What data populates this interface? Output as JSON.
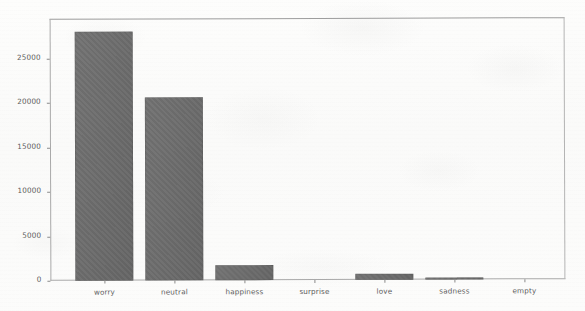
{
  "chart_data": {
    "type": "bar",
    "title": "",
    "subtitle": "",
    "xlabel": "",
    "ylabel": "",
    "categories": [
      "worry",
      "neutral",
      "happiness",
      "surprise",
      "love",
      "sadness",
      "empty"
    ],
    "values": [
      28000,
      20600,
      1700,
      0,
      700,
      250,
      0
    ],
    "series": [
      {
        "name": "count",
        "values": [
          28000,
          20600,
          1700,
          0,
          700,
          250,
          0
        ]
      }
    ],
    "ylim": [
      0,
      29500
    ],
    "yticks": [
      0,
      5000,
      10000,
      15000,
      20000,
      25000
    ],
    "ytick_labels": [
      "0",
      "5000",
      "10000",
      "15000",
      "20000",
      "25000"
    ],
    "grid": false,
    "legend": null,
    "legend_position": "none",
    "bar_color": "#6b6b6b",
    "frame_color": "#a9a9a9",
    "text_color": "#5a5a5a",
    "background_color": "#fcfcfb"
  },
  "axis": {
    "y_tick_labels": [
      "25000",
      "20000",
      "15000",
      "10000",
      "5000",
      "0"
    ],
    "x_tick_labels": [
      "worry",
      "neutral",
      "happiness",
      "surprise",
      "love",
      "sadness",
      "empty"
    ]
  }
}
